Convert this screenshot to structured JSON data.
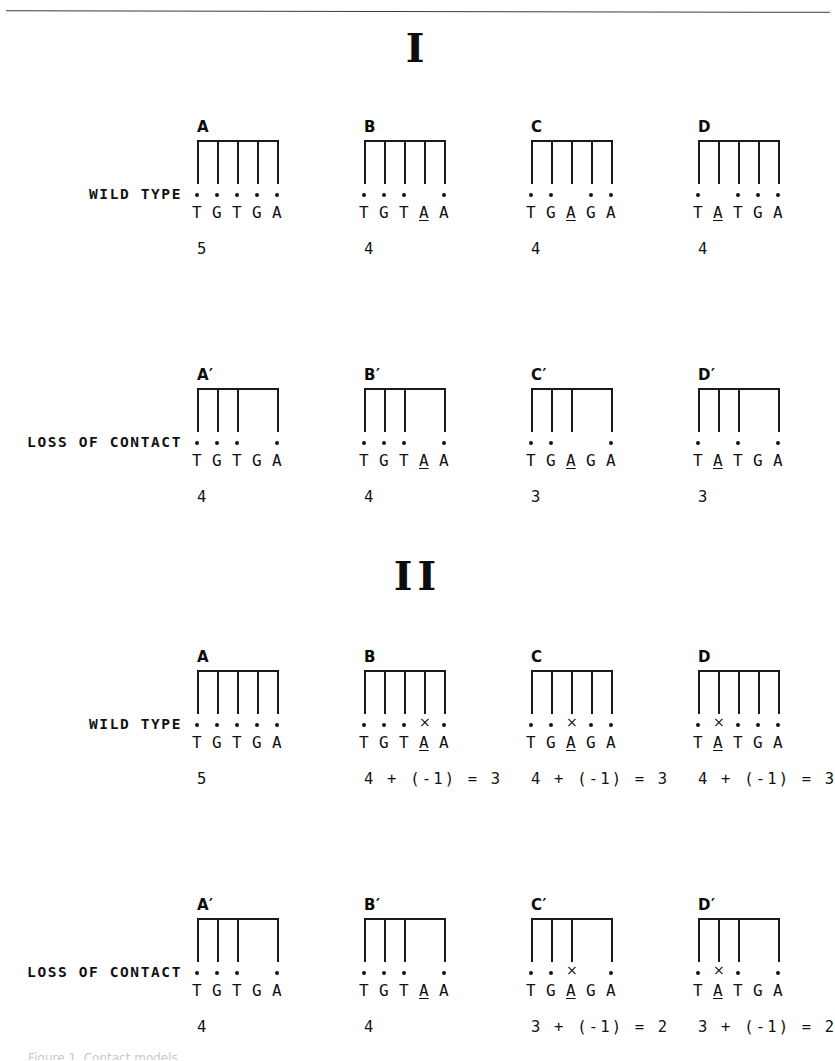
{
  "figure": {
    "top_rule": true,
    "clipped_caption": "Figure 1. Contact models"
  },
  "sections": [
    {
      "numeral": "I",
      "rows": [
        {
          "label": "WILD TYPE",
          "panels": [
            {
              "letter": "A",
              "teeth": [
                1,
                2,
                3,
                4,
                5
              ],
              "markers": [
                "dot",
                "dot",
                "dot",
                "dot",
                "dot"
              ],
              "bases": [
                "T",
                "G",
                "T",
                "G",
                "A"
              ],
              "mutant_index": null,
              "score": "5"
            },
            {
              "letter": "B",
              "teeth": [
                1,
                2,
                3,
                4,
                5
              ],
              "markers": [
                "dot",
                "dot",
                "dot",
                "none",
                "dot"
              ],
              "bases": [
                "T",
                "G",
                "T",
                "A",
                "A"
              ],
              "mutant_index": 3,
              "score": "4"
            },
            {
              "letter": "C",
              "teeth": [
                1,
                2,
                3,
                4,
                5
              ],
              "markers": [
                "dot",
                "dot",
                "none",
                "dot",
                "dot"
              ],
              "bases": [
                "T",
                "G",
                "A",
                "G",
                "A"
              ],
              "mutant_index": 2,
              "score": "4"
            },
            {
              "letter": "D",
              "teeth": [
                1,
                2,
                3,
                4,
                5
              ],
              "markers": [
                "dot",
                "none",
                "dot",
                "dot",
                "dot"
              ],
              "bases": [
                "T",
                "A",
                "T",
                "G",
                "A"
              ],
              "mutant_index": 1,
              "score": "4"
            }
          ]
        },
        {
          "label": "LOSS OF CONTACT",
          "panels": [
            {
              "letter": "A′",
              "teeth": [
                1,
                2,
                3,
                5
              ],
              "markers": [
                "dot",
                "dot",
                "dot",
                "none",
                "dot"
              ],
              "bases": [
                "T",
                "G",
                "T",
                "G",
                "A"
              ],
              "mutant_index": null,
              "score": "4"
            },
            {
              "letter": "B′",
              "teeth": [
                1,
                2,
                3,
                5
              ],
              "markers": [
                "dot",
                "dot",
                "dot",
                "none",
                "dot"
              ],
              "bases": [
                "T",
                "G",
                "T",
                "A",
                "A"
              ],
              "mutant_index": 3,
              "score": "4"
            },
            {
              "letter": "C′",
              "teeth": [
                1,
                2,
                3,
                5
              ],
              "markers": [
                "dot",
                "dot",
                "none",
                "none",
                "dot"
              ],
              "bases": [
                "T",
                "G",
                "A",
                "G",
                "A"
              ],
              "mutant_index": 2,
              "score": "3"
            },
            {
              "letter": "D′",
              "teeth": [
                1,
                2,
                3,
                5
              ],
              "markers": [
                "dot",
                "none",
                "dot",
                "none",
                "dot"
              ],
              "bases": [
                "T",
                "A",
                "T",
                "G",
                "A"
              ],
              "mutant_index": 1,
              "score": "3"
            }
          ]
        }
      ]
    },
    {
      "numeral": "II",
      "rows": [
        {
          "label": "WILD TYPE",
          "panels": [
            {
              "letter": "A",
              "teeth": [
                1,
                2,
                3,
                4,
                5
              ],
              "markers": [
                "dot",
                "dot",
                "dot",
                "dot",
                "dot"
              ],
              "bases": [
                "T",
                "G",
                "T",
                "G",
                "A"
              ],
              "mutant_index": null,
              "score": "5"
            },
            {
              "letter": "B",
              "teeth": [
                1,
                2,
                3,
                4,
                5
              ],
              "markers": [
                "dot",
                "dot",
                "dot",
                "cross",
                "dot"
              ],
              "bases": [
                "T",
                "G",
                "T",
                "A",
                "A"
              ],
              "mutant_index": 3,
              "score": "4 + (-1) = 3"
            },
            {
              "letter": "C",
              "teeth": [
                1,
                2,
                3,
                4,
                5
              ],
              "markers": [
                "dot",
                "dot",
                "cross",
                "dot",
                "dot"
              ],
              "bases": [
                "T",
                "G",
                "A",
                "G",
                "A"
              ],
              "mutant_index": 2,
              "score": "4 + (-1) = 3"
            },
            {
              "letter": "D",
              "teeth": [
                1,
                2,
                3,
                4,
                5
              ],
              "markers": [
                "dot",
                "cross",
                "dot",
                "dot",
                "dot"
              ],
              "bases": [
                "T",
                "A",
                "T",
                "G",
                "A"
              ],
              "mutant_index": 1,
              "score": "4 + (-1) = 3"
            }
          ]
        },
        {
          "label": "LOSS OF CONTACT",
          "panels": [
            {
              "letter": "A′",
              "teeth": [
                1,
                2,
                3,
                5
              ],
              "markers": [
                "dot",
                "dot",
                "dot",
                "none",
                "dot"
              ],
              "bases": [
                "T",
                "G",
                "T",
                "G",
                "A"
              ],
              "mutant_index": null,
              "score": "4"
            },
            {
              "letter": "B′",
              "teeth": [
                1,
                2,
                3,
                5
              ],
              "markers": [
                "dot",
                "dot",
                "dot",
                "none",
                "dot"
              ],
              "bases": [
                "T",
                "G",
                "T",
                "A",
                "A"
              ],
              "mutant_index": 3,
              "score": "4"
            },
            {
              "letter": "C′",
              "teeth": [
                1,
                2,
                3,
                5
              ],
              "markers": [
                "dot",
                "dot",
                "cross",
                "none",
                "dot"
              ],
              "bases": [
                "T",
                "G",
                "A",
                "G",
                "A"
              ],
              "mutant_index": 2,
              "score": "3 + (-1) = 2"
            },
            {
              "letter": "D′",
              "teeth": [
                1,
                2,
                3,
                5
              ],
              "markers": [
                "dot",
                "cross",
                "dot",
                "none",
                "dot"
              ],
              "bases": [
                "T",
                "A",
                "T",
                "G",
                "A"
              ],
              "mutant_index": 1,
              "score": "3 + (-1) = 2"
            }
          ]
        }
      ]
    }
  ]
}
